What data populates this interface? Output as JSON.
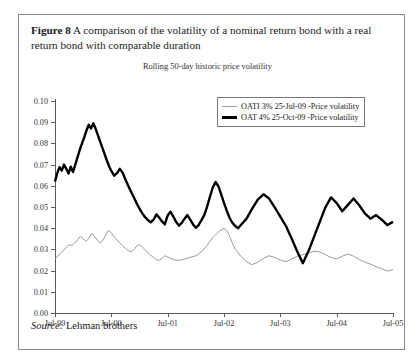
{
  "caption": {
    "figure_label": "Figure 8",
    "text": "A comparison of the volatility of a nominal return bond with a real return bond with comparable duration"
  },
  "source": {
    "label": "Source:",
    "value": "Lehman brothers"
  },
  "colors": {
    "nominal_line": "#000000",
    "real_line": "#9a9a9a",
    "axis": "#5a5a5a",
    "frame": "#8a8a8a",
    "text": "#1a1a1a"
  },
  "chart_data": {
    "type": "line",
    "title": "Rolling 50-day historic price volatility",
    "xlabel": "",
    "ylabel": "",
    "ylim": [
      0.0,
      0.1
    ],
    "grid": false,
    "legend_position": "top-right",
    "ytick_labels": [
      "0.10",
      "0.09",
      "0.08",
      "0.07",
      "0.06",
      "0.05",
      "0.04",
      "0.03",
      "0.02",
      "0.01",
      "0.00"
    ],
    "ytick_values": [
      0.1,
      0.09,
      0.08,
      0.07,
      0.06,
      0.05,
      0.04,
      0.03,
      0.02,
      0.01,
      0.0
    ],
    "categories": [
      "Jul-99",
      "Jul-00",
      "Jul-01",
      "Jul-02",
      "Jul-03",
      "Jul-04",
      "Jul-05"
    ],
    "xtick_labels": [
      "Jul-99",
      "Jul-00",
      "Jul-01",
      "Jul-02",
      "Jul-03",
      "Jul-04",
      "Jul-05"
    ],
    "xlim": [
      0,
      6
    ],
    "series": [
      {
        "name": "OATI 3% 25-Jul-09 -Price volatility",
        "style": "thin",
        "color": "#9a9a9a",
        "x": [
          0.0,
          0.05,
          0.1,
          0.15,
          0.2,
          0.25,
          0.3,
          0.35,
          0.4,
          0.45,
          0.5,
          0.55,
          0.6,
          0.65,
          0.7,
          0.75,
          0.8,
          0.85,
          0.9,
          0.95,
          1.0,
          1.05,
          1.1,
          1.15,
          1.2,
          1.25,
          1.3,
          1.35,
          1.4,
          1.45,
          1.5,
          1.55,
          1.6,
          1.65,
          1.7,
          1.75,
          1.8,
          1.85,
          1.9,
          1.95,
          2.0,
          2.1,
          2.2,
          2.3,
          2.4,
          2.5,
          2.6,
          2.7,
          2.8,
          2.9,
          3.0,
          3.05,
          3.1,
          3.15,
          3.2,
          3.3,
          3.4,
          3.5,
          3.6,
          3.7,
          3.8,
          3.9,
          4.0,
          4.1,
          4.2,
          4.3,
          4.4,
          4.5,
          4.6,
          4.7,
          4.8,
          4.9,
          5.0,
          5.1,
          5.2,
          5.3,
          5.4,
          5.5,
          5.6,
          5.7,
          5.8,
          5.9,
          6.0
        ],
        "y": [
          0.0255,
          0.0268,
          0.0282,
          0.0295,
          0.031,
          0.0322,
          0.0318,
          0.033,
          0.0345,
          0.0362,
          0.035,
          0.0338,
          0.0352,
          0.0375,
          0.0362,
          0.0345,
          0.033,
          0.0342,
          0.0368,
          0.039,
          0.0378,
          0.036,
          0.0345,
          0.033,
          0.0318,
          0.0305,
          0.0295,
          0.0288,
          0.03,
          0.0315,
          0.0322,
          0.0312,
          0.0298,
          0.0285,
          0.0272,
          0.0262,
          0.0252,
          0.0248,
          0.0258,
          0.027,
          0.0265,
          0.0252,
          0.0248,
          0.0255,
          0.0262,
          0.027,
          0.0288,
          0.032,
          0.0355,
          0.0382,
          0.04,
          0.0388,
          0.0362,
          0.033,
          0.03,
          0.0268,
          0.0242,
          0.0228,
          0.024,
          0.0258,
          0.027,
          0.0262,
          0.025,
          0.0242,
          0.0255,
          0.0268,
          0.0275,
          0.0282,
          0.0292,
          0.0288,
          0.0275,
          0.0262,
          0.0255,
          0.0268,
          0.0278,
          0.0268,
          0.0252,
          0.024,
          0.023,
          0.0218,
          0.0208,
          0.0198,
          0.0205
        ]
      },
      {
        "name": "OAT 4% 25-Oct-09 -Price volatility",
        "style": "thick",
        "color": "#000000",
        "x": [
          0.0,
          0.04,
          0.08,
          0.12,
          0.16,
          0.2,
          0.24,
          0.28,
          0.32,
          0.36,
          0.4,
          0.44,
          0.48,
          0.52,
          0.56,
          0.6,
          0.64,
          0.68,
          0.72,
          0.76,
          0.8,
          0.84,
          0.88,
          0.92,
          0.96,
          1.0,
          1.05,
          1.1,
          1.15,
          1.2,
          1.25,
          1.3,
          1.35,
          1.4,
          1.45,
          1.5,
          1.55,
          1.6,
          1.65,
          1.7,
          1.75,
          1.8,
          1.85,
          1.9,
          1.95,
          2.0,
          2.05,
          2.1,
          2.15,
          2.2,
          2.25,
          2.3,
          2.35,
          2.4,
          2.45,
          2.5,
          2.55,
          2.6,
          2.65,
          2.7,
          2.75,
          2.8,
          2.85,
          2.9,
          2.95,
          3.0,
          3.05,
          3.1,
          3.15,
          3.2,
          3.25,
          3.3,
          3.4,
          3.5,
          3.6,
          3.7,
          3.8,
          3.9,
          4.0,
          4.1,
          4.2,
          4.3,
          4.4,
          4.5,
          4.6,
          4.7,
          4.8,
          4.9,
          5.0,
          5.1,
          5.2,
          5.3,
          5.4,
          5.5,
          5.6,
          5.7,
          5.8,
          5.9,
          6.0
        ],
        "y": [
          0.062,
          0.066,
          0.0688,
          0.0672,
          0.07,
          0.068,
          0.0658,
          0.069,
          0.0665,
          0.07,
          0.0735,
          0.077,
          0.08,
          0.083,
          0.0862,
          0.0888,
          0.087,
          0.0895,
          0.087,
          0.084,
          0.081,
          0.078,
          0.075,
          0.072,
          0.0692,
          0.067,
          0.0648,
          0.066,
          0.068,
          0.0662,
          0.063,
          0.06,
          0.0572,
          0.0545,
          0.0518,
          0.0492,
          0.047,
          0.0452,
          0.0438,
          0.0428,
          0.044,
          0.0465,
          0.045,
          0.0432,
          0.0418,
          0.046,
          0.0478,
          0.0455,
          0.043,
          0.0412,
          0.0425,
          0.0445,
          0.0462,
          0.044,
          0.0418,
          0.0402,
          0.0415,
          0.0438,
          0.0462,
          0.0502,
          0.0548,
          0.0592,
          0.0618,
          0.0598,
          0.056,
          0.052,
          0.0482,
          0.0448,
          0.0425,
          0.041,
          0.04,
          0.0415,
          0.0445,
          0.0492,
          0.0535,
          0.056,
          0.054,
          0.0498,
          0.0455,
          0.041,
          0.0352,
          0.029,
          0.0235,
          0.0292,
          0.036,
          0.043,
          0.0498,
          0.0545,
          0.0518,
          0.048,
          0.051,
          0.054,
          0.0508,
          0.047,
          0.0445,
          0.0462,
          0.044,
          0.0415,
          0.043
        ]
      }
    ]
  }
}
